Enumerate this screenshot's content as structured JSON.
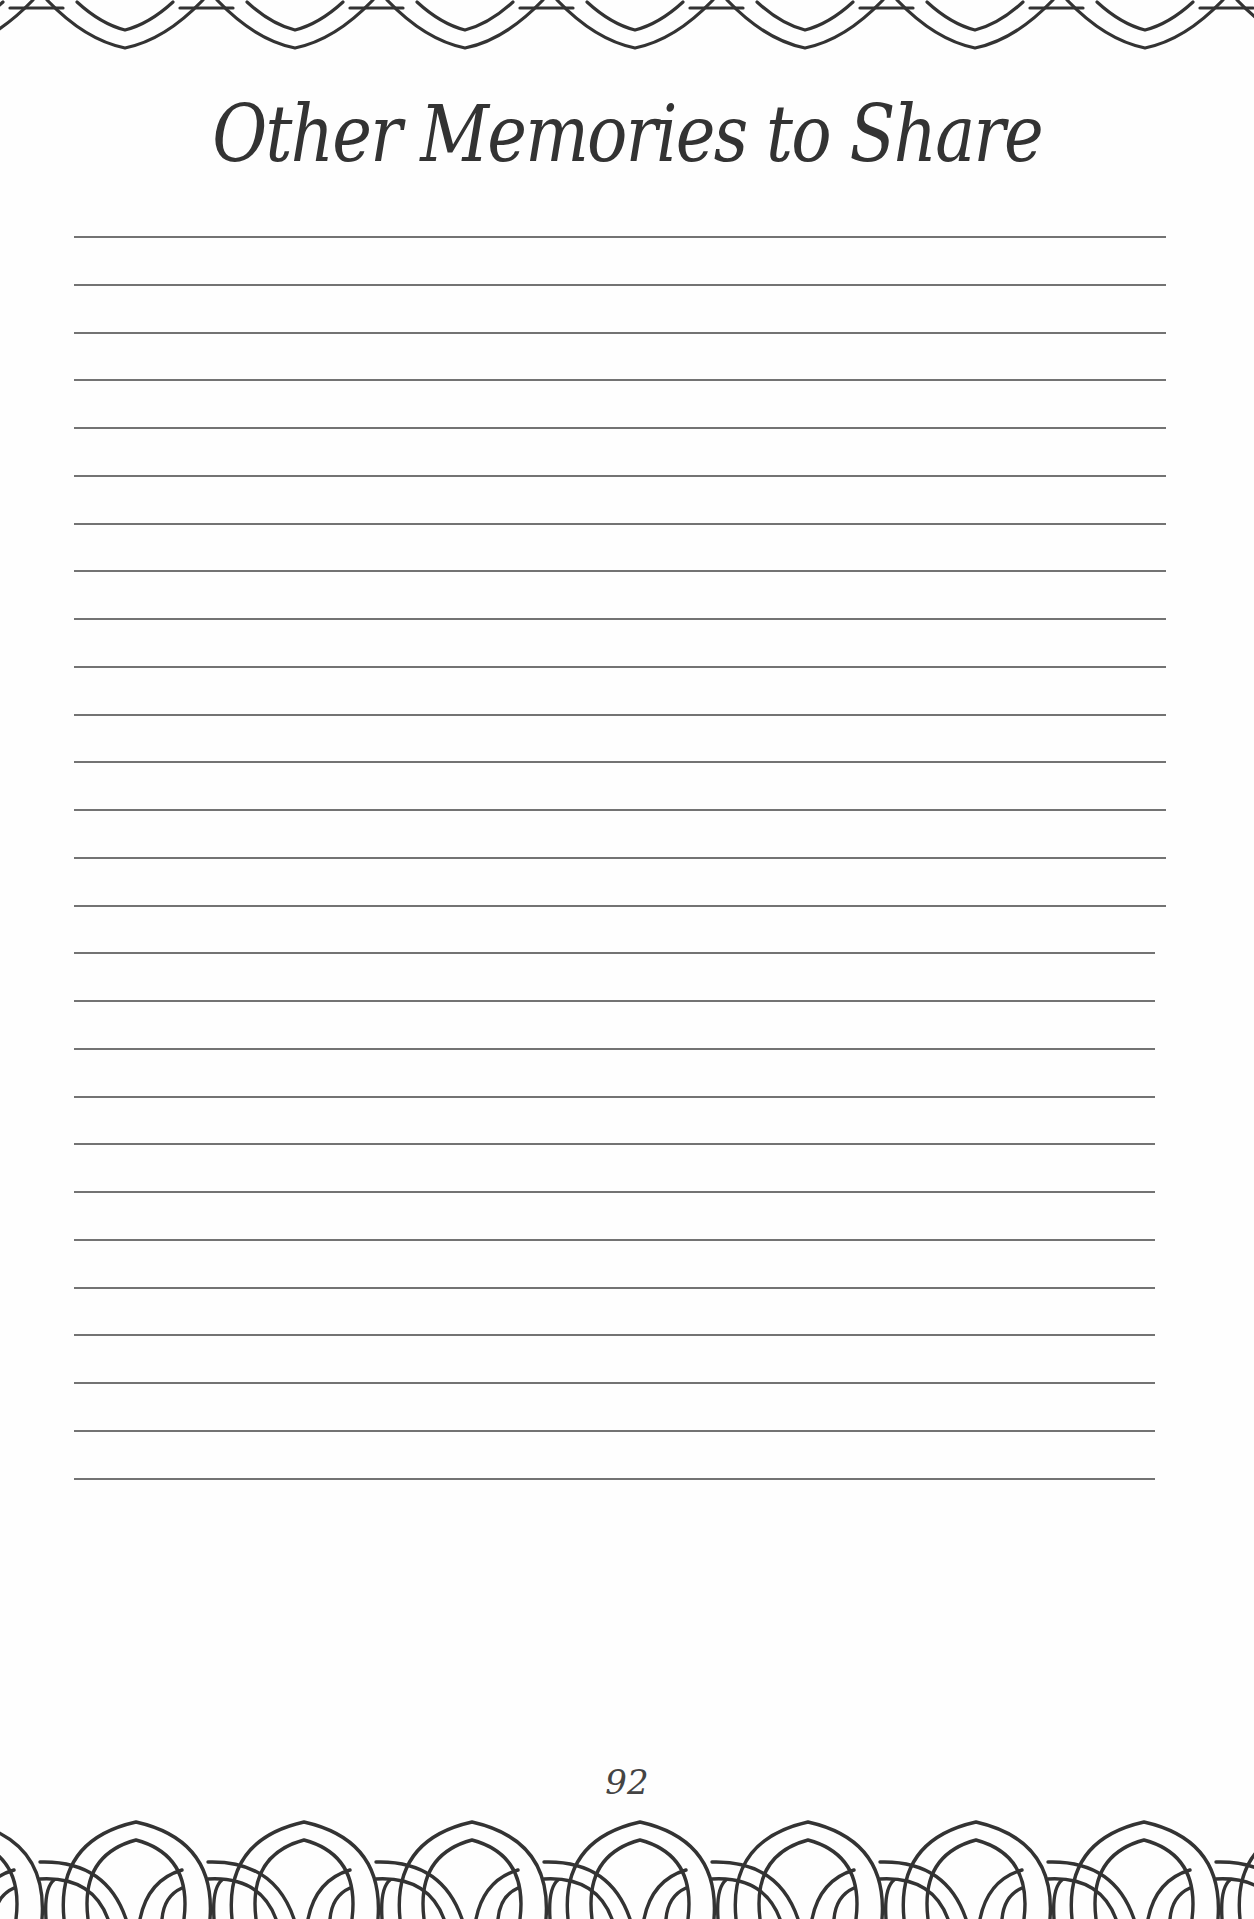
{
  "page": {
    "title": "Other Memories to Share",
    "page_number": "92",
    "ink_color": "#333333",
    "rule_color": "#5a5a5a",
    "background": "#fefefe"
  },
  "writing_area": {
    "line_count": 27,
    "first_line_y": 236,
    "line_spacing": 47.75,
    "left_x": 74,
    "right_x_first_15": 1166,
    "right_x_remaining": 1155
  },
  "decorations": {
    "top_border": "interlocking-arc-border-icon",
    "bottom_border": "interlocking-arc-border-icon"
  }
}
